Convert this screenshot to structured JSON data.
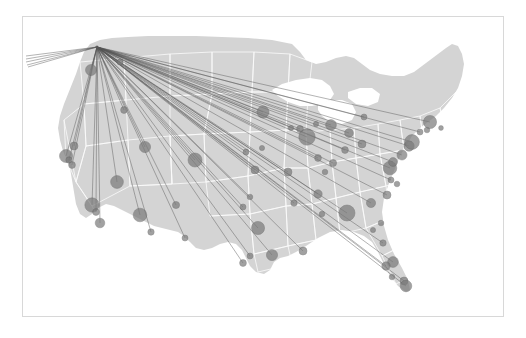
{
  "figure": {
    "kind": "route-map",
    "title": "",
    "frame": {
      "x": 22,
      "y": 16,
      "width": 482,
      "height": 301,
      "border_color": "#d8d8d8"
    },
    "background_color": "#ffffff"
  },
  "chart_data": {
    "type": "scatter",
    "title": "",
    "subtitle": "",
    "xlabel": "",
    "ylabel": "",
    "legend": [],
    "grid": false,
    "projection": "albers-usa",
    "style": {
      "land_fill": "#d4d4d4",
      "state_border": "#ffffff",
      "water_fill": "#ffffff",
      "route_color": "#555555",
      "route_opacity": 0.75,
      "route_width": 0.6,
      "node_fill": "#7a7a7a",
      "node_stroke": "#5a5a5a",
      "node_opacity": 0.7
    },
    "hub": {
      "name": "Seattle",
      "x": 97,
      "y": 47,
      "size": 0
    },
    "categories": [
      "Seattle",
      "Portland",
      "San Francisco",
      "Oakland",
      "San Jose",
      "Sacramento",
      "Los Angeles",
      "Orange County",
      "San Diego",
      "Las Vegas",
      "Phoenix",
      "Tucson",
      "Salt Lake City",
      "Boise",
      "Spokane",
      "Denver",
      "Albuquerque",
      "El Paso",
      "Kansas City",
      "Omaha",
      "Minneapolis",
      "Chicago",
      "Milwaukee",
      "Detroit",
      "Cleveland",
      "Columbus",
      "Cincinnati",
      "Indianapolis",
      "St. Louis",
      "Nashville",
      "Memphis",
      "Dallas",
      "Austin",
      "Houston",
      "San Antonio",
      "New Orleans",
      "Atlanta",
      "Charlotte",
      "Raleigh",
      "Washington DC",
      "Baltimore",
      "Philadelphia",
      "Newark",
      "New York",
      "Hartford",
      "Boston",
      "Providence",
      "Pittsburgh",
      "Buffalo",
      "Richmond",
      "Jacksonville",
      "Orlando",
      "Tampa",
      "Fort Myers",
      "Fort Lauderdale",
      "Miami",
      "Birmingham",
      "Oklahoma City",
      "Tulsa",
      "Des Moines",
      "Madison",
      "Grand Rapids",
      "Louisville",
      "Charleston",
      "Savannah",
      "Norfolk",
      "Nantucket",
      "Anchorage",
      "Honolulu",
      "Kahului",
      "Lihue",
      "Kona"
    ],
    "points": [
      {
        "name": "Portland",
        "x": 91,
        "y": 70,
        "size": 5.5,
        "route": true
      },
      {
        "name": "Sacramento",
        "x": 74,
        "y": 146,
        "size": 4.0,
        "route": true
      },
      {
        "name": "San Francisco",
        "x": 66,
        "y": 156,
        "size": 6.5,
        "route": true
      },
      {
        "name": "Oakland",
        "x": 69,
        "y": 160,
        "size": 3.2,
        "route": true
      },
      {
        "name": "San Jose",
        "x": 72,
        "y": 165,
        "size": 3.4,
        "route": true
      },
      {
        "name": "Los Angeles",
        "x": 92,
        "y": 205,
        "size": 7.2,
        "route": true
      },
      {
        "name": "Orange County",
        "x": 96,
        "y": 212,
        "size": 3.4,
        "route": true
      },
      {
        "name": "San Diego",
        "x": 100,
        "y": 223,
        "size": 4.8,
        "route": true
      },
      {
        "name": "Las Vegas",
        "x": 117,
        "y": 182,
        "size": 6.4,
        "route": true
      },
      {
        "name": "Phoenix",
        "x": 140,
        "y": 215,
        "size": 6.8,
        "route": true
      },
      {
        "name": "Tucson",
        "x": 151,
        "y": 232,
        "size": 3.2,
        "route": true
      },
      {
        "name": "Boise",
        "x": 124,
        "y": 110,
        "size": 3.4,
        "route": true
      },
      {
        "name": "Spokane",
        "x": 120,
        "y": 62,
        "size": 3.0,
        "route": true
      },
      {
        "name": "Salt Lake City",
        "x": 145,
        "y": 147,
        "size": 5.6,
        "route": true
      },
      {
        "name": "Albuquerque",
        "x": 176,
        "y": 205,
        "size": 3.6,
        "route": true
      },
      {
        "name": "El Paso",
        "x": 185,
        "y": 238,
        "size": 3.0,
        "route": true
      },
      {
        "name": "Denver",
        "x": 195,
        "y": 160,
        "size": 7.0,
        "route": true
      },
      {
        "name": "Oklahoma City",
        "x": 243,
        "y": 207,
        "size": 3.0,
        "route": true
      },
      {
        "name": "Tulsa",
        "x": 250,
        "y": 197,
        "size": 2.8,
        "route": true
      },
      {
        "name": "Dallas",
        "x": 258,
        "y": 228,
        "size": 6.6,
        "route": true
      },
      {
        "name": "Austin",
        "x": 250,
        "y": 256,
        "size": 3.0,
        "route": true
      },
      {
        "name": "San Antonio",
        "x": 243,
        "y": 263,
        "size": 3.4,
        "route": true
      },
      {
        "name": "Houston",
        "x": 272,
        "y": 255,
        "size": 5.6,
        "route": true
      },
      {
        "name": "Kansas City",
        "x": 255,
        "y": 170,
        "size": 4.0,
        "route": true
      },
      {
        "name": "Omaha",
        "x": 246,
        "y": 152,
        "size": 3.0,
        "route": true
      },
      {
        "name": "Des Moines",
        "x": 262,
        "y": 148,
        "size": 2.6,
        "route": false
      },
      {
        "name": "Minneapolis",
        "x": 263,
        "y": 112,
        "size": 6.0,
        "route": true
      },
      {
        "name": "Madison",
        "x": 291,
        "y": 128,
        "size": 2.6,
        "route": false
      },
      {
        "name": "Milwaukee",
        "x": 300,
        "y": 129,
        "size": 3.4,
        "route": true
      },
      {
        "name": "Chicago",
        "x": 307,
        "y": 137,
        "size": 8.2,
        "route": true
      },
      {
        "name": "St. Louis",
        "x": 288,
        "y": 172,
        "size": 4.0,
        "route": true
      },
      {
        "name": "Memphis",
        "x": 294,
        "y": 203,
        "size": 3.2,
        "route": true
      },
      {
        "name": "Nashville",
        "x": 318,
        "y": 194,
        "size": 4.2,
        "route": true
      },
      {
        "name": "New Orleans",
        "x": 303,
        "y": 251,
        "size": 4.0,
        "route": true
      },
      {
        "name": "Birmingham",
        "x": 322,
        "y": 214,
        "size": 2.8,
        "route": false
      },
      {
        "name": "Indianapolis",
        "x": 318,
        "y": 158,
        "size": 3.4,
        "route": true
      },
      {
        "name": "Louisville",
        "x": 325,
        "y": 172,
        "size": 2.8,
        "route": false
      },
      {
        "name": "Cincinnati",
        "x": 333,
        "y": 163,
        "size": 3.6,
        "route": true
      },
      {
        "name": "Grand Rapids",
        "x": 316,
        "y": 124,
        "size": 2.6,
        "route": false
      },
      {
        "name": "Detroit",
        "x": 331,
        "y": 125,
        "size": 5.4,
        "route": true
      },
      {
        "name": "Cleveland",
        "x": 349,
        "y": 133,
        "size": 4.4,
        "route": true
      },
      {
        "name": "Columbus",
        "x": 345,
        "y": 150,
        "size": 3.4,
        "route": true
      },
      {
        "name": "Buffalo",
        "x": 364,
        "y": 117,
        "size": 3.0,
        "route": true
      },
      {
        "name": "Pittsburgh",
        "x": 362,
        "y": 144,
        "size": 4.0,
        "route": true
      },
      {
        "name": "Atlanta",
        "x": 347,
        "y": 213,
        "size": 8.0,
        "route": true
      },
      {
        "name": "Charlotte",
        "x": 371,
        "y": 203,
        "size": 4.6,
        "route": true
      },
      {
        "name": "Raleigh",
        "x": 387,
        "y": 195,
        "size": 4.0,
        "route": true
      },
      {
        "name": "Savannah",
        "x": 373,
        "y": 230,
        "size": 2.6,
        "route": false
      },
      {
        "name": "Charleston",
        "x": 381,
        "y": 223,
        "size": 2.8,
        "route": false
      },
      {
        "name": "Richmond",
        "x": 391,
        "y": 180,
        "size": 3.0,
        "route": true
      },
      {
        "name": "Norfolk",
        "x": 397,
        "y": 184,
        "size": 2.8,
        "route": false
      },
      {
        "name": "Washington DC",
        "x": 390,
        "y": 168,
        "size": 6.8,
        "route": true
      },
      {
        "name": "Baltimore",
        "x": 393,
        "y": 162,
        "size": 4.4,
        "route": true
      },
      {
        "name": "Philadelphia",
        "x": 402,
        "y": 155,
        "size": 5.0,
        "route": true
      },
      {
        "name": "Newark",
        "x": 409,
        "y": 146,
        "size": 5.2,
        "route": true
      },
      {
        "name": "New York",
        "x": 412,
        "y": 142,
        "size": 7.4,
        "route": true
      },
      {
        "name": "Hartford",
        "x": 420,
        "y": 132,
        "size": 3.0,
        "route": true
      },
      {
        "name": "Providence",
        "x": 427,
        "y": 130,
        "size": 2.8,
        "route": false
      },
      {
        "name": "Boston",
        "x": 430,
        "y": 122,
        "size": 6.6,
        "route": true
      },
      {
        "name": "Nantucket",
        "x": 441,
        "y": 128,
        "size": 2.4,
        "route": false
      },
      {
        "name": "Jacksonville",
        "x": 383,
        "y": 243,
        "size": 3.2,
        "route": true
      },
      {
        "name": "Orlando",
        "x": 393,
        "y": 262,
        "size": 5.4,
        "route": true
      },
      {
        "name": "Tampa",
        "x": 386,
        "y": 266,
        "size": 4.2,
        "route": true
      },
      {
        "name": "Fort Myers",
        "x": 392,
        "y": 277,
        "size": 2.8,
        "route": false
      },
      {
        "name": "Fort Lauderdale",
        "x": 404,
        "y": 281,
        "size": 4.0,
        "route": true
      },
      {
        "name": "Miami",
        "x": 406,
        "y": 286,
        "size": 5.8,
        "route": true
      }
    ],
    "offmap_routes": [
      {
        "name": "Anchorage",
        "x": 26,
        "y": 56
      },
      {
        "name": "Honolulu",
        "x": 26,
        "y": 59
      },
      {
        "name": "Kahului",
        "x": 26,
        "y": 62
      },
      {
        "name": "Lihue",
        "x": 27,
        "y": 65
      },
      {
        "name": "Kona",
        "x": 28,
        "y": 67
      }
    ]
  }
}
